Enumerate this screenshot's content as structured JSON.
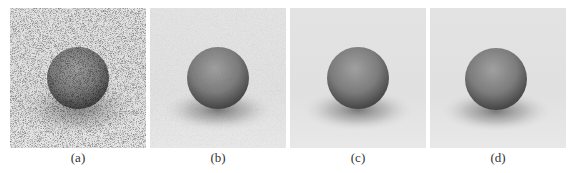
{
  "figure": {
    "panels": [
      {
        "id": "a",
        "label": "(a)",
        "content": "noisy rendered sphere on plane",
        "noise": "high"
      },
      {
        "id": "b",
        "label": "(b)",
        "content": "denoised rendered sphere on plane",
        "noise": "low"
      },
      {
        "id": "c",
        "label": "(c)",
        "content": "denoised rendered sphere on plane",
        "noise": "very low"
      },
      {
        "id": "d",
        "label": "(d)",
        "content": "reference rendered sphere on plane",
        "noise": "none"
      }
    ],
    "colors": {
      "background": "#e6e6e6",
      "sphere_light": "#9a9a9a",
      "sphere_dark": "#3e3e3e",
      "shadow": "#4a4a4a"
    }
  }
}
